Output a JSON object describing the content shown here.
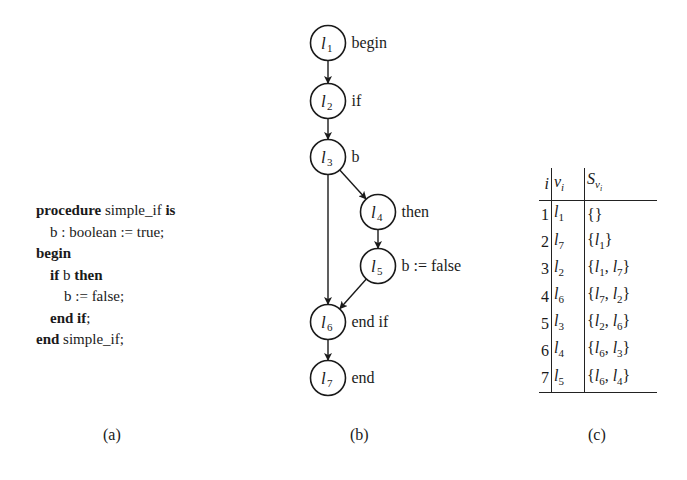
{
  "panel_a": {
    "caption": "(a)",
    "code_lines": [
      {
        "indent": 0,
        "parts": [
          {
            "text": "procedure",
            "bold": true
          },
          {
            "text": " simple_if ",
            "bold": false
          },
          {
            "text": "is",
            "bold": true
          }
        ]
      },
      {
        "indent": 1,
        "parts": [
          {
            "text": "b : boolean := true;",
            "bold": false
          }
        ]
      },
      {
        "indent": 0,
        "parts": [
          {
            "text": "begin",
            "bold": true
          }
        ]
      },
      {
        "indent": 1,
        "parts": [
          {
            "text": "if",
            "bold": true
          },
          {
            "text": " b ",
            "bold": false
          },
          {
            "text": "then",
            "bold": true
          }
        ]
      },
      {
        "indent": 2,
        "parts": [
          {
            "text": "b := false;",
            "bold": false
          }
        ]
      },
      {
        "indent": 1,
        "parts": [
          {
            "text": "end if",
            "bold": true
          },
          {
            "text": ";",
            "bold": false
          }
        ]
      },
      {
        "indent": 0,
        "parts": [
          {
            "text": "end",
            "bold": true
          },
          {
            "text": " simple_if;",
            "bold": false
          }
        ]
      }
    ]
  },
  "panel_b": {
    "caption": "(b)",
    "nodes": [
      {
        "id": "l1",
        "var": "l",
        "sub": "1",
        "label": "begin",
        "cx": 328,
        "cy": 43
      },
      {
        "id": "l2",
        "var": "l",
        "sub": "2",
        "label": "if",
        "cx": 328,
        "cy": 101
      },
      {
        "id": "l3",
        "var": "l",
        "sub": "3",
        "label": "b",
        "cx": 328,
        "cy": 157
      },
      {
        "id": "l4",
        "var": "l",
        "sub": "4",
        "label": "then",
        "cx": 378,
        "cy": 212
      },
      {
        "id": "l5",
        "var": "l",
        "sub": "5",
        "label": "b := false",
        "cx": 378,
        "cy": 266
      },
      {
        "id": "l6",
        "var": "l",
        "sub": "6",
        "label": "end if",
        "cx": 328,
        "cy": 322
      },
      {
        "id": "l7",
        "var": "l",
        "sub": "7",
        "label": "end",
        "cx": 328,
        "cy": 378
      }
    ],
    "edges": [
      [
        "l1",
        "l2"
      ],
      [
        "l2",
        "l3"
      ],
      [
        "l3",
        "l4"
      ],
      [
        "l3",
        "l6"
      ],
      [
        "l4",
        "l5"
      ],
      [
        "l5",
        "l6"
      ],
      [
        "l6",
        "l7"
      ]
    ]
  },
  "panel_c": {
    "caption": "(c)",
    "headers": {
      "i": "i",
      "v": "v",
      "v_sub": "i",
      "s": "S",
      "s_sub": "v",
      "s_subsub": "i"
    },
    "rows": [
      {
        "i": "1",
        "v_sub": "1",
        "set": []
      },
      {
        "i": "2",
        "v_sub": "7",
        "set": [
          "1"
        ]
      },
      {
        "i": "3",
        "v_sub": "2",
        "set": [
          "1",
          "7"
        ]
      },
      {
        "i": "4",
        "v_sub": "6",
        "set": [
          "7",
          "2"
        ]
      },
      {
        "i": "5",
        "v_sub": "3",
        "set": [
          "2",
          "6"
        ]
      },
      {
        "i": "6",
        "v_sub": "4",
        "set": [
          "6",
          "3"
        ]
      },
      {
        "i": "7",
        "v_sub": "5",
        "set": [
          "6",
          "4"
        ]
      }
    ]
  }
}
